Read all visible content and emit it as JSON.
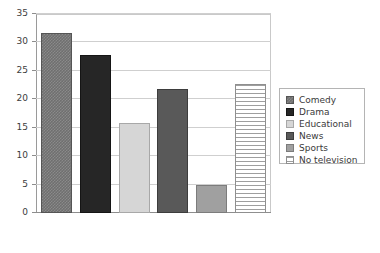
{
  "chart_data": {
    "type": "bar",
    "title": "",
    "subtitle": "",
    "xlabel": "",
    "ylabel": "",
    "categories": [
      "Comedy",
      "Drama",
      "Educational",
      "News",
      "Sports",
      "No television"
    ],
    "values": [
      32,
      28,
      16,
      22,
      5,
      23
    ],
    "ylim": [
      0,
      35
    ],
    "ytick_values": [
      0,
      5,
      10,
      15,
      20,
      25,
      30,
      35
    ],
    "ytick_labels": [
      "0",
      "5",
      "10",
      "15",
      "20",
      "25",
      "30",
      "35"
    ],
    "xtick_labels": [],
    "grid": "horizontal",
    "legend_position": "right",
    "series": [
      {
        "name": "Comedy",
        "value": 32,
        "fill": "checker",
        "color": "#6f6f6f"
      },
      {
        "name": "Drama",
        "value": 28,
        "fill": "solid-dark",
        "color": "#262626"
      },
      {
        "name": "Educational",
        "value": 16,
        "fill": "light",
        "color": "#d6d6d6"
      },
      {
        "name": "News",
        "value": 22,
        "fill": "darkgray",
        "color": "#595959"
      },
      {
        "name": "Sports",
        "value": 5,
        "fill": "midgray",
        "color": "#a0a0a0"
      },
      {
        "name": "No television",
        "value": 23,
        "fill": "hstripe",
        "color": "#9e9e9e"
      }
    ]
  },
  "legend": {
    "entries": [
      {
        "label": "Comedy",
        "fill": "checker"
      },
      {
        "label": "Drama",
        "fill": "solid-dark"
      },
      {
        "label": "Educational",
        "fill": "light"
      },
      {
        "label": "News",
        "fill": "darkgray"
      },
      {
        "label": "Sports",
        "fill": "midgray"
      },
      {
        "label": "No television",
        "fill": "hstripe"
      }
    ]
  },
  "axis": {
    "y_max": 35,
    "y_min": 0,
    "y_step": 5
  }
}
